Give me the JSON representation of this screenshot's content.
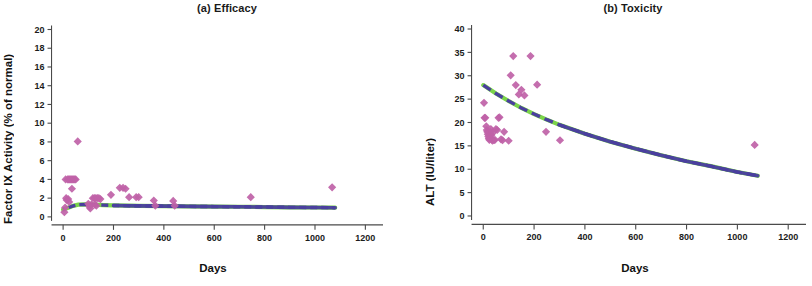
{
  "figure": {
    "background": "#ffffff",
    "marker_color": "#c062a8",
    "curve_color_primary": "#7bd44a",
    "curve_color_secondary": "#4a3f9e",
    "axis_color": "#4a4a4a"
  },
  "chart_data": [
    {
      "type": "scatter",
      "panel_id": "a",
      "title": "(a) Efficacy",
      "xlabel": "Days",
      "ylabel": "Factor IX Activity (% of normal)",
      "xlim": [
        -60,
        1270
      ],
      "ylim": [
        -1.4,
        20.8
      ],
      "xticks": [
        0,
        200,
        400,
        600,
        800,
        1000,
        1200
      ],
      "yticks": [
        0,
        2,
        4,
        6,
        8,
        10,
        12,
        14,
        16,
        18,
        20
      ],
      "grid": false,
      "legend": "none",
      "points": [
        {
          "x": 5,
          "y": 0.5
        },
        {
          "x": 8,
          "y": 1.0
        },
        {
          "x": 10,
          "y": 4.0
        },
        {
          "x": 12,
          "y": 2.0
        },
        {
          "x": 14,
          "y": 1.8
        },
        {
          "x": 18,
          "y": 4.0
        },
        {
          "x": 22,
          "y": 4.0
        },
        {
          "x": 26,
          "y": 4.0
        },
        {
          "x": 30,
          "y": 4.0
        },
        {
          "x": 34,
          "y": 4.0
        },
        {
          "x": 38,
          "y": 4.0
        },
        {
          "x": 42,
          "y": 4.0
        },
        {
          "x": 46,
          "y": 4.0
        },
        {
          "x": 50,
          "y": 4.0
        },
        {
          "x": 35,
          "y": 3.0
        },
        {
          "x": 58,
          "y": 8.05
        },
        {
          "x": 20,
          "y": 1.9
        },
        {
          "x": 24,
          "y": 1.6
        },
        {
          "x": 100,
          "y": 1.4
        },
        {
          "x": 104,
          "y": 1.1
        },
        {
          "x": 108,
          "y": 0.9
        },
        {
          "x": 112,
          "y": 1.3
        },
        {
          "x": 118,
          "y": 2.0
        },
        {
          "x": 124,
          "y": 2.0
        },
        {
          "x": 130,
          "y": 2.0
        },
        {
          "x": 136,
          "y": 2.0
        },
        {
          "x": 142,
          "y": 2.0
        },
        {
          "x": 148,
          "y": 1.9
        },
        {
          "x": 126,
          "y": 1.3
        },
        {
          "x": 132,
          "y": 1.2
        },
        {
          "x": 190,
          "y": 2.35
        },
        {
          "x": 225,
          "y": 3.1
        },
        {
          "x": 238,
          "y": 3.1
        },
        {
          "x": 248,
          "y": 3.0
        },
        {
          "x": 262,
          "y": 2.1
        },
        {
          "x": 290,
          "y": 2.1
        },
        {
          "x": 300,
          "y": 2.1
        },
        {
          "x": 360,
          "y": 1.75
        },
        {
          "x": 366,
          "y": 1.2
        },
        {
          "x": 437,
          "y": 1.7
        },
        {
          "x": 443,
          "y": 1.2
        },
        {
          "x": 745,
          "y": 2.1
        },
        {
          "x": 1068,
          "y": 3.15
        }
      ],
      "fit_curve": {
        "description": "model fit, rises from ~0.8 at day 0 to plateau ~1.1 then slowly declines to ~0.95",
        "x": [
          0,
          20,
          40,
          60,
          90,
          120,
          160,
          200,
          300,
          400,
          500,
          600,
          700,
          800,
          900,
          1000,
          1080
        ],
        "y": [
          0.78,
          0.98,
          1.18,
          1.3,
          1.33,
          1.3,
          1.25,
          1.22,
          1.18,
          1.15,
          1.12,
          1.1,
          1.08,
          1.05,
          1.02,
          1.0,
          0.98
        ]
      }
    },
    {
      "type": "scatter",
      "panel_id": "b",
      "title": "(b) Toxicity",
      "xlabel": "Days",
      "ylabel": "ALT (IU/liter)",
      "xlim": [
        -60,
        1270
      ],
      "ylim": [
        -3.0,
        41.5
      ],
      "xticks": [
        0,
        200,
        400,
        600,
        800,
        1000,
        1200
      ],
      "yticks": [
        0,
        5,
        10,
        15,
        20,
        25,
        30,
        35,
        40
      ],
      "grid": false,
      "legend": "none",
      "points": [
        {
          "x": 3,
          "y": 24.2
        },
        {
          "x": 5,
          "y": 21.0
        },
        {
          "x": 8,
          "y": 21.0
        },
        {
          "x": 12,
          "y": 19.2
        },
        {
          "x": 14,
          "y": 18.4
        },
        {
          "x": 16,
          "y": 18.0
        },
        {
          "x": 18,
          "y": 17.5
        },
        {
          "x": 20,
          "y": 17.0
        },
        {
          "x": 22,
          "y": 16.6
        },
        {
          "x": 24,
          "y": 16.3
        },
        {
          "x": 26,
          "y": 17.2
        },
        {
          "x": 28,
          "y": 18.0
        },
        {
          "x": 30,
          "y": 18.6
        },
        {
          "x": 32,
          "y": 17.3
        },
        {
          "x": 34,
          "y": 16.4
        },
        {
          "x": 36,
          "y": 16.1
        },
        {
          "x": 38,
          "y": 17.8
        },
        {
          "x": 42,
          "y": 16.2
        },
        {
          "x": 46,
          "y": 16.3
        },
        {
          "x": 50,
          "y": 18.6
        },
        {
          "x": 55,
          "y": 18.4
        },
        {
          "x": 60,
          "y": 21.0
        },
        {
          "x": 64,
          "y": 21.1
        },
        {
          "x": 70,
          "y": 16.4
        },
        {
          "x": 76,
          "y": 16.2
        },
        {
          "x": 82,
          "y": 18.0
        },
        {
          "x": 100,
          "y": 16.1
        },
        {
          "x": 108,
          "y": 30.1
        },
        {
          "x": 118,
          "y": 34.2
        },
        {
          "x": 128,
          "y": 28.0
        },
        {
          "x": 140,
          "y": 26.0
        },
        {
          "x": 150,
          "y": 27.0
        },
        {
          "x": 162,
          "y": 25.8
        },
        {
          "x": 186,
          "y": 34.2
        },
        {
          "x": 212,
          "y": 28.1
        },
        {
          "x": 247,
          "y": 18.0
        },
        {
          "x": 302,
          "y": 16.2
        },
        {
          "x": 1068,
          "y": 15.2
        }
      ],
      "fit_curve": {
        "description": "monotonic exponential-like decay from ~28 IU/liter at day 0 to ~8.6 at day 1080",
        "x": [
          0,
          50,
          100,
          150,
          200,
          250,
          300,
          400,
          500,
          600,
          700,
          800,
          900,
          1000,
          1080
        ],
        "y": [
          28.0,
          26.2,
          24.6,
          23.1,
          21.8,
          20.6,
          19.5,
          17.6,
          15.9,
          14.4,
          13.0,
          11.7,
          10.6,
          9.4,
          8.6
        ]
      }
    }
  ]
}
